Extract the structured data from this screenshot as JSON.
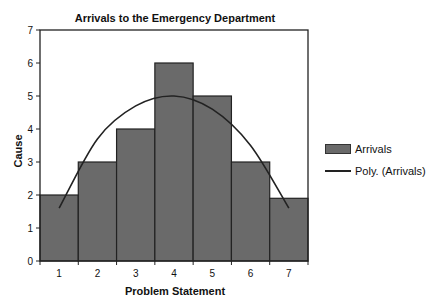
{
  "chart_data": {
    "type": "bar",
    "title": "Arrivals to the Emergency Department",
    "xlabel": "Problem Statement",
    "ylabel": "Cause",
    "categories": [
      "1",
      "2",
      "3",
      "4",
      "5",
      "6",
      "7"
    ],
    "series": [
      {
        "name": "Arrivals",
        "type": "bar",
        "values": [
          2,
          3,
          4,
          6,
          5,
          3,
          1.9
        ],
        "color": "#6a6a6a"
      },
      {
        "name": "Poly. (Arrivals)",
        "type": "line",
        "trendline": "polynomial",
        "values": [
          1.6,
          3.7,
          4.7,
          5.0,
          4.6,
          3.5,
          1.6
        ],
        "color": "#222222"
      }
    ],
    "ylim": [
      0,
      7
    ],
    "yticks": [
      0,
      1,
      2,
      3,
      4,
      5,
      6,
      7
    ],
    "grid": false,
    "legend_position": "right"
  },
  "legend": {
    "items": [
      {
        "label": "Arrivals",
        "kind": "bar"
      },
      {
        "label": "Poly. (Arrivals)",
        "kind": "line"
      }
    ]
  }
}
